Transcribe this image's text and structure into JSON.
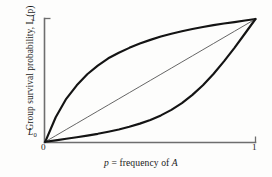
{
  "figure": {
    "background_color": "#fdfdfc",
    "curve_color": "#141414",
    "axis_color": "#6e6e6e",
    "diagonal_color": "#4a4a4a"
  },
  "axes": {
    "y_label": "Group survival probability, L (p)",
    "x_label_pre": "p",
    "x_label_mid": " = frequency of ",
    "x_label_post": "A",
    "y_tick_top": "1",
    "x_tick_left": "0",
    "x_tick_right": "1",
    "origin_label_text": "L",
    "origin_label_sub": "0"
  },
  "chart_data": {
    "type": "line",
    "title": "",
    "subtitle": "",
    "xlabel": "p = frequency of A",
    "ylabel": "Group survival probability, L(p)",
    "xlim": [
      0,
      1
    ],
    "ylim": [
      0,
      1
    ],
    "xticks": [
      0,
      1
    ],
    "xticklabels": [
      "0",
      "1"
    ],
    "yticks": [
      0,
      1
    ],
    "yticklabels": [
      "L0",
      "1"
    ],
    "grid": false,
    "legend": null,
    "annotations": [
      {
        "text": "L0",
        "x": 0,
        "y": 0,
        "note": "baseline group survival probability at p = 0"
      },
      {
        "text": "1",
        "x": 0,
        "y": 1,
        "note": "maximum survival probability"
      },
      {
        "text": "0",
        "x": 0,
        "y": 0,
        "note": "x axis origin"
      },
      {
        "text": "1",
        "x": 1,
        "y": 0,
        "note": "x axis maximum frequency"
      }
    ],
    "x": [
      0,
      0.05,
      0.1,
      0.15,
      0.2,
      0.25,
      0.3,
      0.35,
      0.4,
      0.45,
      0.5,
      0.55,
      0.6,
      0.65,
      0.7,
      0.75,
      0.8,
      0.85,
      0.9,
      0.95,
      1
    ],
    "series": [
      {
        "name": "concave (diminishing returns) L(p)",
        "style": "thick",
        "values": [
          0,
          0.2,
          0.35,
          0.46,
          0.55,
          0.62,
          0.68,
          0.725,
          0.765,
          0.8,
          0.83,
          0.857,
          0.88,
          0.9,
          0.918,
          0.935,
          0.95,
          0.963,
          0.975,
          0.988,
          1
        ]
      },
      {
        "name": "linear L(p)",
        "style": "thin",
        "values": [
          0,
          0.05,
          0.1,
          0.15,
          0.2,
          0.25,
          0.3,
          0.35,
          0.4,
          0.45,
          0.5,
          0.55,
          0.6,
          0.65,
          0.7,
          0.75,
          0.8,
          0.85,
          0.9,
          0.95,
          1
        ]
      },
      {
        "name": "convex (accelerating) L(p)",
        "style": "thick",
        "values": [
          0,
          0.012,
          0.025,
          0.037,
          0.05,
          0.065,
          0.082,
          0.1,
          0.122,
          0.148,
          0.178,
          0.215,
          0.26,
          0.315,
          0.382,
          0.46,
          0.552,
          0.655,
          0.765,
          0.882,
          1
        ]
      }
    ]
  }
}
